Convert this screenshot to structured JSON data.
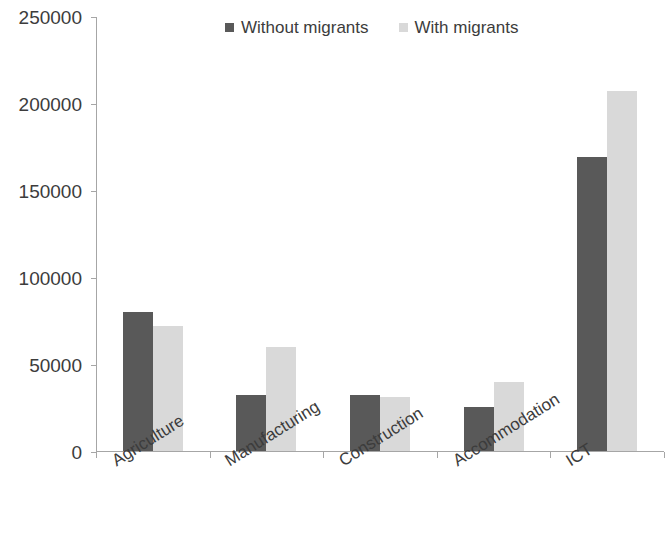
{
  "chart_data": {
    "type": "bar",
    "title": "",
    "subtitle": "",
    "xlabel": "",
    "ylabel": "",
    "categories": [
      "Agriculture",
      "Manufacturing",
      "Construction",
      "Accommodation",
      "ICT"
    ],
    "series": [
      {
        "name": "Without migrants",
        "color": "#595959",
        "values": [
          80000,
          32000,
          32000,
          25000,
          169000
        ]
      },
      {
        "name": "With migrants",
        "color": "#d9d9d9",
        "values": [
          72000,
          60000,
          31000,
          39500,
          207000
        ]
      }
    ],
    "ylim": [
      0,
      250000
    ],
    "y_ticks": [
      0,
      50000,
      100000,
      150000,
      200000,
      250000
    ],
    "y_tick_labels": [
      "0",
      "50000",
      "100000",
      "150000",
      "200000",
      "250000"
    ],
    "grid": false,
    "legend_position": "top",
    "axis_color": "#a6a6a6",
    "text_color": "#3c3c3c",
    "background": "#ffffff"
  },
  "legend": {
    "entries": [
      {
        "label": "Without migrants",
        "swatch_name": "legend-swatch-without-migrants"
      },
      {
        "label": "With migrants",
        "swatch_name": "legend-swatch-with-migrants"
      }
    ]
  }
}
